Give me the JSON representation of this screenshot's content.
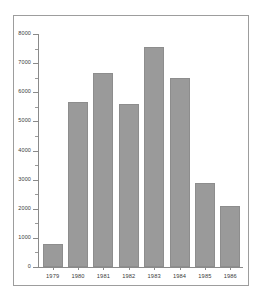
{
  "chart_data": {
    "type": "bar",
    "title": "",
    "subtitle": "",
    "xlabel": "",
    "ylabel": "",
    "categories": [
      "1979",
      "1980",
      "1981",
      "1982",
      "1983",
      "1984",
      "1985",
      "1986"
    ],
    "values": [
      800,
      5650,
      6650,
      5600,
      7550,
      6500,
      2900,
      2100
    ],
    "series": [
      {
        "name": "",
        "values": [
          800,
          5650,
          6650,
          5600,
          7550,
          6500,
          2900,
          2100
        ]
      }
    ],
    "ylim": [
      0,
      8000
    ],
    "y_ticks": [
      0,
      1000,
      2000,
      3000,
      4000,
      5000,
      6000,
      7000,
      8000
    ],
    "y_tick_labels": [
      "0",
      "1000",
      "2000",
      "3000",
      "4000",
      "5000",
      "6000",
      "7000",
      "8000"
    ],
    "y_minor_tick_interval": 500,
    "grid": false,
    "legend": false,
    "legend_position": "none",
    "annotations": []
  },
  "colors": {
    "bar_fill": "#9a9a9a",
    "bar_border": "#8d8d8d",
    "axis": "#8a8a8a",
    "frame": "#9d9d9d",
    "text": "#3a3a3a",
    "background": "#ffffff"
  }
}
